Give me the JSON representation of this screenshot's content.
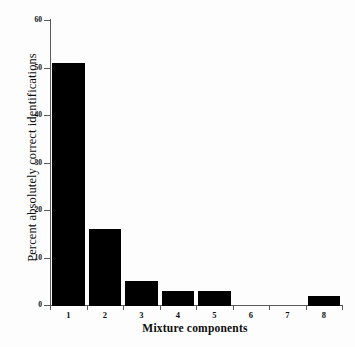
{
  "chart_data": {
    "type": "bar",
    "title": "",
    "xlabel": "Mixture components",
    "ylabel": "Percent absolutely correct identifications",
    "categories": [
      "1",
      "2",
      "3",
      "4",
      "5",
      "6",
      "7",
      "8"
    ],
    "values": [
      51,
      16,
      5,
      3,
      3,
      0,
      0,
      2
    ],
    "ylim": [
      0,
      60
    ],
    "yticks": [
      0,
      10,
      20,
      30,
      40,
      50,
      60
    ],
    "ytick_labels": [
      "0",
      "10",
      "20",
      "30",
      "40",
      "50",
      "60"
    ],
    "grid": false,
    "legend": null,
    "bar_color": "#000000",
    "background_color": "#ffffff",
    "axis_color": "#5a5a5a"
  }
}
